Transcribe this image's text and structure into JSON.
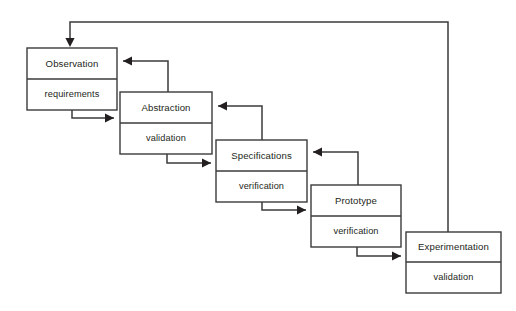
{
  "diagram": {
    "type": "flow-diagram",
    "canvas": {
      "width": 516,
      "height": 311
    },
    "colors": {
      "background": "#ffffff",
      "box_fill": "#ffffff",
      "stroke": "#3b3b3b",
      "text": "#231f20"
    },
    "nodes": [
      {
        "id": "observation",
        "label": "Observation",
        "sublabel": "requirements",
        "x": 27,
        "y": 48,
        "width": 90,
        "height": 62,
        "split_y": 79
      },
      {
        "id": "abstraction",
        "label": "Abstraction",
        "sublabel": "validation",
        "x": 120,
        "y": 92,
        "width": 92,
        "height": 62,
        "split_y": 123
      },
      {
        "id": "specifications",
        "label": "Specifications",
        "sublabel": "verification",
        "x": 216,
        "y": 140,
        "width": 91,
        "height": 62,
        "split_y": 171
      },
      {
        "id": "prototype",
        "label": "Prototype",
        "sublabel": "verification",
        "x": 311,
        "y": 185,
        "width": 90,
        "height": 62,
        "split_y": 216
      },
      {
        "id": "experimentation",
        "label": "Experimentation",
        "sublabel": "validation",
        "x": 406,
        "y": 232,
        "width": 95,
        "height": 61,
        "split_y": 262
      }
    ],
    "connectors": [
      {
        "id": "observation-to-abstraction",
        "kind": "forward",
        "from": "observation",
        "to": "abstraction",
        "path": "M 72 110 L 72 118 L 114 118",
        "arrow": {
          "x": 114,
          "y": 118,
          "dir": "right"
        }
      },
      {
        "id": "abstraction-to-observation",
        "kind": "feedback",
        "from": "abstraction",
        "to": "observation",
        "path": "M 168 92 L 168 61 L 123 61",
        "arrow": {
          "x": 123,
          "y": 61,
          "dir": "left"
        }
      },
      {
        "id": "abstraction-to-specifications",
        "kind": "forward",
        "from": "abstraction",
        "to": "specifications",
        "path": "M 167 154 L 167 163 L 211 163",
        "arrow": {
          "x": 211,
          "y": 163,
          "dir": "right"
        }
      },
      {
        "id": "specifications-to-abstraction",
        "kind": "feedback",
        "from": "specifications",
        "to": "abstraction",
        "path": "M 262 140 L 262 106 L 218 106",
        "arrow": {
          "x": 218,
          "y": 106,
          "dir": "left"
        }
      },
      {
        "id": "specifications-to-prototype",
        "kind": "forward",
        "from": "specifications",
        "to": "prototype",
        "path": "M 262 201 L 262 210 L 306 210",
        "arrow": {
          "x": 306,
          "y": 210,
          "dir": "right"
        }
      },
      {
        "id": "prototype-to-specifications",
        "kind": "feedback",
        "from": "prototype",
        "to": "specifications",
        "path": "M 358 185 L 358 152 L 313 152",
        "arrow": {
          "x": 313,
          "y": 152,
          "dir": "left"
        }
      },
      {
        "id": "prototype-to-experimentation",
        "kind": "forward",
        "from": "prototype",
        "to": "experimentation",
        "path": "M 357 247 L 357 256 L 401 256",
        "arrow": {
          "x": 401,
          "y": 256,
          "dir": "right"
        }
      },
      {
        "id": "experimentation-to-observation",
        "kind": "global-feedback",
        "from": "experimentation",
        "to": "observation",
        "path": "M 448 232 L 448 22 L 70 22 L 70 42",
        "arrow": {
          "x": 70,
          "y": 47,
          "dir": "down"
        }
      }
    ]
  }
}
